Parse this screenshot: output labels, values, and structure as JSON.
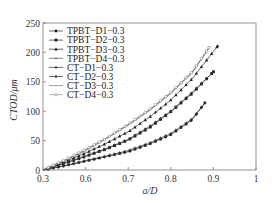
{
  "chart_data": {
    "type": "line",
    "title": "",
    "xlabel": "a/D",
    "ylabel": "CTOD/μm",
    "xlim": [
      0.5,
      1.0
    ],
    "ylim": [
      0,
      250
    ],
    "x_tick_labels": [
      "0.3",
      "0.6",
      "0.7",
      "0.8",
      "0.9",
      "1"
    ],
    "x_tick_positions": [
      0.5,
      0.6,
      0.7,
      0.8,
      0.9,
      1.0
    ],
    "y_ticks": [
      0,
      50,
      100,
      150,
      200,
      250
    ],
    "grid": false,
    "legend_position": "upper-left-inside",
    "series": [
      {
        "name": "TPBT−D1−0.3",
        "marker": "filled-circle",
        "color": "#222222",
        "x": [
          0.5,
          0.55,
          0.6,
          0.65,
          0.7,
          0.75,
          0.8,
          0.85,
          0.88
        ],
        "y": [
          0,
          7,
          15,
          23,
          31,
          44,
          60,
          85,
          114
        ]
      },
      {
        "name": "TPBT−D2−0.3",
        "marker": "filled-square",
        "color": "#222222",
        "x": [
          0.5,
          0.55,
          0.6,
          0.65,
          0.7,
          0.75,
          0.8,
          0.85,
          0.9
        ],
        "y": [
          0,
          11,
          23,
          36,
          51,
          72,
          99,
          130,
          167
        ]
      },
      {
        "name": "TPBT−D3−0.3",
        "marker": "filled-triangle",
        "color": "#222222",
        "x": [
          0.5,
          0.55,
          0.6,
          0.65,
          0.7,
          0.75,
          0.8,
          0.85,
          0.91
        ],
        "y": [
          0,
          14,
          29,
          46,
          65,
          90,
          119,
          155,
          211
        ]
      },
      {
        "name": "TPBT−D4−0.3",
        "marker": "dash",
        "color": "#555555",
        "x": [
          0.5,
          0.55,
          0.6,
          0.65,
          0.7,
          0.75,
          0.8,
          0.85,
          0.89
        ],
        "y": [
          0,
          16,
          33,
          54,
          77,
          102,
          131,
          166,
          209
        ]
      },
      {
        "name": "CT−D1−0.3",
        "marker": "star",
        "color": "#333333",
        "x": [
          0.5,
          0.55,
          0.6,
          0.65,
          0.7,
          0.75,
          0.8,
          0.85,
          0.88
        ],
        "y": [
          0,
          7,
          16,
          24,
          33,
          46,
          62,
          87,
          114
        ]
      },
      {
        "name": "CT−D2−0.3",
        "marker": "diamond",
        "color": "#333333",
        "x": [
          0.5,
          0.55,
          0.6,
          0.65,
          0.7,
          0.75,
          0.8,
          0.85,
          0.9
        ],
        "y": [
          0,
          12,
          24,
          37,
          52,
          74,
          100,
          132,
          167
        ]
      },
      {
        "name": "CT−D3−0.3",
        "marker": "none",
        "color": "#777777",
        "x": [
          0.5,
          0.55,
          0.6,
          0.65,
          0.7,
          0.75,
          0.8,
          0.85,
          0.89
        ],
        "y": [
          0,
          16,
          34,
          54,
          76,
          101,
          130,
          165,
          207
        ]
      },
      {
        "name": "CT−D4−0.3",
        "marker": "open-circle",
        "color": "#888888",
        "x": [
          0.5,
          0.55,
          0.6,
          0.65,
          0.7,
          0.75,
          0.8,
          0.85,
          0.89
        ],
        "y": [
          0,
          17,
          35,
          55,
          78,
          103,
          132,
          167,
          208
        ]
      }
    ]
  },
  "plot": {
    "left": 43,
    "right": 256,
    "top": 23,
    "bottom": 170
  }
}
